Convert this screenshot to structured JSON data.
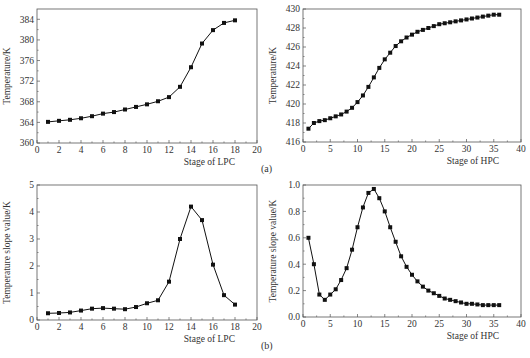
{
  "figure": {
    "row_labels": [
      "(a)",
      "(b)"
    ]
  },
  "chart_data": [
    {
      "id": "a-lpc",
      "type": "line",
      "title": "",
      "xlabel": "Stage of LPC",
      "ylabel": "Temperature/K",
      "xlim": [
        0,
        20
      ],
      "ylim": [
        360,
        386
      ],
      "xticks": [
        0,
        2,
        4,
        6,
        8,
        10,
        12,
        14,
        16,
        18,
        20
      ],
      "yticks": [
        360,
        364,
        368,
        372,
        376,
        380,
        384
      ],
      "ytick_decimals": 0,
      "grid": false,
      "marker": "square",
      "frame": {
        "left": 37,
        "top": 9,
        "right": 257,
        "bottom": 143
      },
      "x": [
        1,
        2,
        3,
        4,
        5,
        6,
        7,
        8,
        9,
        10,
        11,
        12,
        13,
        14,
        15,
        16,
        17,
        18
      ],
      "values": [
        364.1,
        364.3,
        364.5,
        364.8,
        365.2,
        365.7,
        366.0,
        366.5,
        367.0,
        367.5,
        368.1,
        368.9,
        370.9,
        374.7,
        379.3,
        381.9,
        383.3,
        383.8
      ]
    },
    {
      "id": "a-hpc",
      "type": "line",
      "title": "",
      "xlabel": "Stage of HPC",
      "ylabel": "Temperature/K",
      "xlim": [
        0,
        40
      ],
      "ylim": [
        416,
        430
      ],
      "xticks": [
        0,
        5,
        10,
        15,
        20,
        25,
        30,
        35,
        40
      ],
      "yticks": [
        416,
        418,
        420,
        422,
        424,
        426,
        428,
        430
      ],
      "ytick_decimals": 0,
      "grid": false,
      "marker": "square",
      "frame": {
        "left": 303,
        "top": 9,
        "right": 521,
        "bottom": 142
      },
      "x": [
        1,
        2,
        3,
        4,
        5,
        6,
        7,
        8,
        9,
        10,
        11,
        12,
        13,
        14,
        15,
        16,
        17,
        18,
        19,
        20,
        21,
        22,
        23,
        24,
        25,
        26,
        27,
        28,
        29,
        30,
        31,
        32,
        33,
        34,
        35,
        36
      ],
      "values": [
        417.4,
        418.0,
        418.2,
        418.3,
        418.5,
        418.7,
        418.9,
        419.2,
        419.6,
        420.2,
        420.9,
        421.8,
        422.8,
        423.8,
        424.7,
        425.4,
        426.1,
        426.6,
        427.0,
        427.3,
        427.6,
        427.8,
        428.0,
        428.2,
        428.4,
        428.5,
        428.6,
        428.7,
        428.8,
        428.9,
        429.0,
        429.1,
        429.2,
        429.3,
        429.4,
        429.4
      ]
    },
    {
      "id": "b-lpc",
      "type": "line",
      "title": "",
      "xlabel": "Stage of LPC",
      "ylabel": "Temperature slope value/K",
      "xlim": [
        0,
        20
      ],
      "ylim": [
        0,
        5
      ],
      "xticks": [
        0,
        2,
        4,
        6,
        8,
        10,
        12,
        14,
        16,
        18,
        20
      ],
      "yticks": [
        0,
        1,
        2,
        3,
        4,
        5
      ],
      "ytick_decimals": 0,
      "grid": false,
      "marker": "square",
      "frame": {
        "left": 37,
        "top": 185,
        "right": 257,
        "bottom": 320
      },
      "x": [
        1,
        2,
        3,
        4,
        5,
        6,
        7,
        8,
        9,
        10,
        11,
        12,
        13,
        14,
        15,
        16,
        17,
        18
      ],
      "values": [
        0.25,
        0.26,
        0.28,
        0.35,
        0.42,
        0.44,
        0.42,
        0.4,
        0.48,
        0.62,
        0.73,
        1.42,
        3.0,
        4.2,
        3.7,
        2.05,
        0.92,
        0.57
      ]
    },
    {
      "id": "b-hpc",
      "type": "line",
      "title": "",
      "xlabel": "Stage of HPC",
      "ylabel": "Temperature slope value/K",
      "xlim": [
        0,
        40
      ],
      "ylim": [
        0,
        1.0
      ],
      "xticks": [
        0,
        5,
        10,
        15,
        20,
        25,
        30,
        35,
        40
      ],
      "yticks": [
        0.0,
        0.2,
        0.4,
        0.6,
        0.8,
        1.0
      ],
      "ytick_decimals": 1,
      "grid": false,
      "marker": "square",
      "frame": {
        "left": 303,
        "top": 185,
        "right": 521,
        "bottom": 317
      },
      "x": [
        1,
        2,
        3,
        4,
        5,
        6,
        7,
        8,
        9,
        10,
        11,
        12,
        13,
        14,
        15,
        16,
        17,
        18,
        19,
        20,
        21,
        22,
        23,
        24,
        25,
        26,
        27,
        28,
        29,
        30,
        31,
        32,
        33,
        34,
        35,
        36
      ],
      "values": [
        0.6,
        0.4,
        0.17,
        0.13,
        0.17,
        0.21,
        0.28,
        0.37,
        0.51,
        0.68,
        0.83,
        0.94,
        0.97,
        0.9,
        0.8,
        0.68,
        0.57,
        0.46,
        0.38,
        0.32,
        0.27,
        0.23,
        0.2,
        0.18,
        0.16,
        0.14,
        0.13,
        0.12,
        0.11,
        0.1,
        0.1,
        0.095,
        0.09,
        0.09,
        0.09,
        0.09
      ]
    }
  ]
}
